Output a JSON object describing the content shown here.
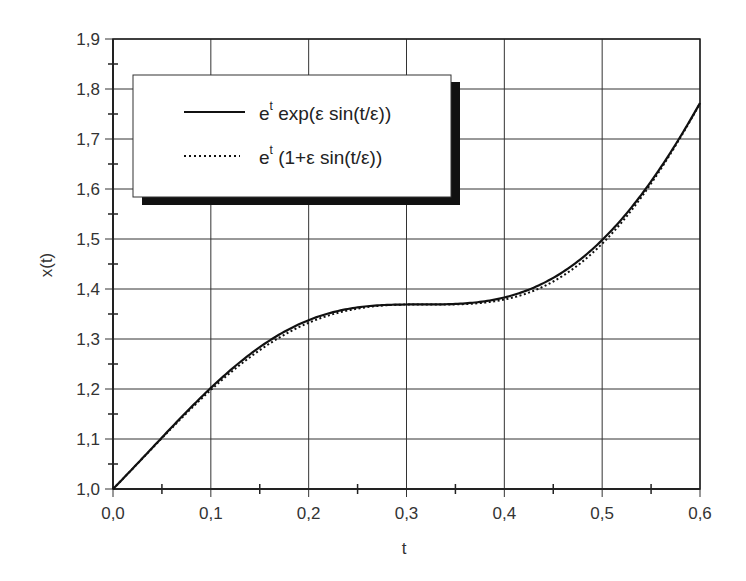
{
  "chart_data": {
    "type": "line",
    "title": "",
    "xlabel": "t",
    "ylabel": "x(t)",
    "xlim": [
      0.0,
      0.6
    ],
    "ylim": [
      1.0,
      1.9
    ],
    "grid": true,
    "legend_position": "upper left (inset box with drop shadow)",
    "x_ticks": [
      "0,0",
      "0,1",
      "0,2",
      "0,3",
      "0,4",
      "0,5",
      "0,6"
    ],
    "y_ticks": [
      "1,0",
      "1,1",
      "1,2",
      "1,3",
      "1,4",
      "1,5",
      "1,6",
      "1,7",
      "1,8",
      "1,9"
    ],
    "x": [
      0.0,
      0.05,
      0.1,
      0.15,
      0.2,
      0.25,
      0.3,
      0.35,
      0.4,
      0.45,
      0.5,
      0.55,
      0.6
    ],
    "series": [
      {
        "name": "e^t exp(ε sin(t/ε))",
        "style": "solid",
        "values": [
          1.0,
          1.1,
          1.202,
          1.282,
          1.336,
          1.361,
          1.369,
          1.37,
          1.38,
          1.418,
          1.496,
          1.619,
          1.772
        ]
      },
      {
        "name": "e^t (1+ε sin(t/ε))",
        "style": "dotted",
        "values": [
          1.0,
          1.099,
          1.198,
          1.276,
          1.331,
          1.359,
          1.369,
          1.369,
          1.379,
          1.414,
          1.491,
          1.614,
          1.771
        ]
      }
    ]
  },
  "legend": {
    "items": [
      {
        "base": "e",
        "sup": "t",
        "rest": " exp(ε sin(t/ε))"
      },
      {
        "base": "e",
        "sup": "t",
        "rest": " (1+ε sin(t/ε))"
      }
    ]
  },
  "params": {
    "epsilon": 0.1
  }
}
